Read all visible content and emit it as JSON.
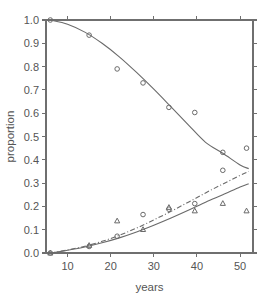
{
  "chart_data": {
    "type": "scatter",
    "title": "",
    "xlabel": "years",
    "ylabel": "proportion",
    "xlim": [
      5,
      53
    ],
    "ylim": [
      0.0,
      1.0
    ],
    "grid": false,
    "legend": "none",
    "xticks": [
      10,
      20,
      30,
      40,
      50
    ],
    "xtick_labels": [
      "10",
      "20",
      "30",
      "40",
      "50"
    ],
    "yticks": [
      0.0,
      0.1,
      0.2,
      0.3,
      0.4,
      0.5,
      0.6,
      0.7,
      0.8,
      0.9,
      1.0
    ],
    "ytick_labels": [
      "0.0",
      "0.1",
      "0.2",
      "0.3",
      "0.4",
      "0.5",
      "0.6",
      "0.7",
      "0.8",
      "0.9",
      "1.0"
    ],
    "series": [
      {
        "name": "upper-observed-circles",
        "marker": "circle",
        "x": [
          6.0,
          15.0,
          21.5,
          27.5,
          33.5,
          39.5,
          46.0,
          51.5
        ],
        "y": [
          1.0,
          0.935,
          0.79,
          0.73,
          0.625,
          0.603,
          0.432,
          0.45
        ]
      },
      {
        "name": "upper-fitted-curve",
        "marker": "none",
        "line": "solid",
        "x": [
          6.0,
          10.0,
          14.0,
          18.0,
          22.0,
          26.0,
          30.0,
          34.0,
          38.0,
          42.0,
          46.0,
          50.0,
          52.0
        ],
        "y": [
          1.0,
          0.982,
          0.948,
          0.9,
          0.842,
          0.775,
          0.703,
          0.627,
          0.55,
          0.475,
          0.428,
          0.378,
          0.362
        ]
      },
      {
        "name": "lower-observed-circles",
        "marker": "circle",
        "x": [
          6.0,
          15.0,
          21.5,
          27.5,
          33.5,
          39.5,
          46.0
        ],
        "y": [
          0.0,
          0.028,
          0.072,
          0.165,
          0.188,
          0.212,
          0.355
        ]
      },
      {
        "name": "lower-observed-triangles",
        "marker": "triangle",
        "x": [
          6.0,
          15.0,
          21.5,
          27.5,
          33.5,
          39.5,
          46.0,
          51.5
        ],
        "y": [
          0.0,
          0.033,
          0.138,
          0.101,
          0.196,
          0.181,
          0.213,
          0.181
        ]
      },
      {
        "name": "lower-fitted-curve-solid",
        "marker": "none",
        "line": "solid",
        "x": [
          6.0,
          10.0,
          14.0,
          18.0,
          22.0,
          26.0,
          30.0,
          34.0,
          38.0,
          42.0,
          46.0,
          50.0,
          52.0
        ],
        "y": [
          0.0,
          0.012,
          0.026,
          0.044,
          0.065,
          0.09,
          0.119,
          0.15,
          0.183,
          0.218,
          0.25,
          0.283,
          0.297
        ]
      },
      {
        "name": "lower-fitted-curve-dashdot",
        "marker": "none",
        "line": "dashdot",
        "x": [
          6.0,
          10.0,
          14.0,
          18.0,
          22.0,
          26.0,
          30.0,
          34.0,
          38.0,
          42.0,
          46.0,
          50.0,
          52.0
        ],
        "y": [
          0.0,
          0.013,
          0.029,
          0.05,
          0.076,
          0.107,
          0.142,
          0.179,
          0.218,
          0.258,
          0.296,
          0.333,
          0.35
        ]
      }
    ]
  }
}
